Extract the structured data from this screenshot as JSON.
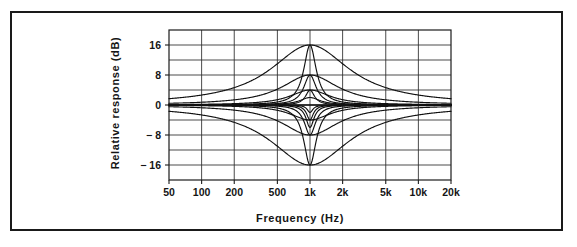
{
  "figure": {
    "border_color": "#1a1a1a",
    "background": "#ffffff",
    "curve_color": "#111111"
  },
  "axis_titles": {
    "x": "Frequency  (Hz)",
    "y": "Relative  response  (dB)"
  },
  "x_ticks": [
    {
      "label": "50",
      "value": 50
    },
    {
      "label": "100",
      "value": 100
    },
    {
      "label": "200",
      "value": 200
    },
    {
      "label": "500",
      "value": 500
    },
    {
      "label": "1k",
      "value": 1000
    },
    {
      "label": "2k",
      "value": 2000
    },
    {
      "label": "5k",
      "value": 5000
    },
    {
      "label": "10k",
      "value": 10000
    },
    {
      "label": "20k",
      "value": 20000
    }
  ],
  "y_ticks": [
    {
      "label": "16",
      "value": 16
    },
    {
      "label": "8",
      "value": 8
    },
    {
      "label": "0",
      "value": 0
    },
    {
      "label": "− 8",
      "value": -8
    },
    {
      "label": "− 16",
      "value": -16
    }
  ],
  "y_gridlines": [
    16,
    12,
    8,
    4,
    0,
    -4,
    -8,
    -12,
    -16
  ],
  "x_gridlines": [
    100,
    200,
    500,
    1000,
    2000,
    5000,
    10000
  ],
  "chart_data": {
    "type": "line",
    "title": "",
    "xlabel": "Frequency  (Hz)",
    "ylabel": "Relative  response  (dB)",
    "xscale": "log",
    "xlim": [
      50,
      20000
    ],
    "ylim": [
      -20,
      20
    ],
    "grid": true,
    "legend": "none",
    "center_frequency_hz": 1000,
    "x": [
      50,
      70,
      100,
      140,
      200,
      300,
      500,
      700,
      1000,
      1400,
      2000,
      3000,
      5000,
      7000,
      10000,
      14000,
      20000
    ],
    "series": [
      {
        "name": "+16 dB wide Q",
        "gain_db": 16,
        "q": 0.5,
        "values": [
          3.9,
          5.8,
          7.8,
          9.7,
          11.6,
          13.4,
          15.2,
          15.8,
          16.0,
          15.8,
          15.2,
          14.0,
          11.6,
          9.7,
          7.8,
          5.8,
          3.9
        ]
      },
      {
        "name": "+8 dB wide Q",
        "gain_db": 8,
        "q": 0.7,
        "values": [
          1.1,
          1.9,
          2.9,
          4.0,
          5.2,
          6.4,
          7.5,
          7.9,
          8.0,
          7.9,
          7.5,
          6.6,
          5.2,
          4.0,
          2.9,
          1.9,
          1.1
        ]
      },
      {
        "name": "+4 dB medium Q",
        "gain_db": 4,
        "q": 1.0,
        "values": [
          0.3,
          0.5,
          0.8,
          1.3,
          1.9,
          2.7,
          3.6,
          3.9,
          4.0,
          3.9,
          3.6,
          2.9,
          1.9,
          1.3,
          0.8,
          0.5,
          0.3
        ]
      },
      {
        "name": "+2 dB narrow Q",
        "gain_db": 2,
        "q": 2.0,
        "values": [
          0.0,
          0.1,
          0.1,
          0.2,
          0.3,
          0.6,
          1.3,
          1.8,
          2.0,
          1.8,
          1.3,
          0.7,
          0.3,
          0.2,
          0.1,
          0.1,
          0.0
        ]
      },
      {
        "name": "+16 dB narrow Q",
        "gain_db": 16,
        "q": 3.2,
        "values": [
          0.1,
          0.2,
          0.4,
          0.8,
          1.5,
          3.1,
          7.2,
          11.4,
          16.0,
          11.4,
          7.2,
          3.6,
          1.5,
          0.8,
          0.4,
          0.2,
          0.1
        ]
      },
      {
        "name": "+8 dB narrow Q",
        "gain_db": 8,
        "q": 3.2,
        "values": [
          0.0,
          0.1,
          0.2,
          0.4,
          0.8,
          1.6,
          3.7,
          5.8,
          8.0,
          5.8,
          3.7,
          1.9,
          0.8,
          0.4,
          0.2,
          0.1,
          0.0
        ]
      },
      {
        "name": "+4 dB very narrow Q",
        "gain_db": 4,
        "q": 4.5,
        "values": [
          0.0,
          0.0,
          0.1,
          0.1,
          0.3,
          0.6,
          1.6,
          2.7,
          4.0,
          2.7,
          1.6,
          0.7,
          0.3,
          0.1,
          0.1,
          0.0,
          0.0
        ]
      },
      {
        "name": "0 dB flat",
        "gain_db": 0,
        "q": 1.0,
        "values": [
          0,
          0,
          0,
          0,
          0,
          0,
          0,
          0,
          0,
          0,
          0,
          0,
          0,
          0,
          0,
          0,
          0
        ]
      },
      {
        "name": "−16 dB wide Q",
        "gain_db": -16,
        "q": 0.5,
        "values": [
          -3.9,
          -5.8,
          -7.8,
          -9.7,
          -11.6,
          -13.4,
          -15.2,
          -15.8,
          -16.0,
          -15.8,
          -15.2,
          -14.0,
          -11.6,
          -9.7,
          -7.8,
          -5.8,
          -3.9
        ]
      },
      {
        "name": "−8 dB wide Q",
        "gain_db": -8,
        "q": 0.7,
        "values": [
          -1.1,
          -1.9,
          -2.9,
          -4.0,
          -5.2,
          -6.4,
          -7.5,
          -7.9,
          -8.0,
          -7.9,
          -7.5,
          -6.6,
          -5.2,
          -4.0,
          -2.9,
          -1.9,
          -1.1
        ]
      },
      {
        "name": "−4 dB medium Q",
        "gain_db": -4,
        "q": 1.0,
        "values": [
          -0.3,
          -0.5,
          -0.8,
          -1.3,
          -1.9,
          -2.7,
          -3.6,
          -3.9,
          -4.0,
          -3.9,
          -3.6,
          -2.9,
          -1.9,
          -1.3,
          -0.8,
          -0.5,
          -0.3
        ]
      },
      {
        "name": "−16 dB narrow Q",
        "gain_db": -16,
        "q": 3.2,
        "values": [
          -0.1,
          -0.2,
          -0.4,
          -0.8,
          -1.5,
          -3.1,
          -7.2,
          -11.4,
          -16.0,
          -11.4,
          -7.2,
          -3.6,
          -1.5,
          -0.8,
          -0.4,
          -0.2,
          -0.1
        ]
      },
      {
        "name": "−8 dB narrow Q",
        "gain_db": -8,
        "q": 3.6,
        "values": [
          0.0,
          -0.1,
          -0.2,
          -0.3,
          -0.6,
          -1.3,
          -3.3,
          -5.5,
          -8.0,
          -5.5,
          -3.3,
          -1.6,
          -0.6,
          -0.3,
          -0.2,
          -0.1,
          0.0
        ]
      },
      {
        "name": "−6 dB very narrow Q",
        "gain_db": -6,
        "q": 5.0,
        "values": [
          0.0,
          0.0,
          0.0,
          -0.1,
          -0.2,
          -0.5,
          -1.7,
          -3.4,
          -6.0,
          -3.4,
          -1.7,
          -0.6,
          -0.2,
          -0.1,
          0.0,
          0.0,
          0.0
        ]
      },
      {
        "name": "−4 dB very narrow Q",
        "gain_db": -4,
        "q": 6.0,
        "values": [
          0.0,
          0.0,
          0.0,
          0.0,
          -0.1,
          -0.3,
          -1.0,
          -2.1,
          -4.0,
          -2.1,
          -1.0,
          -0.3,
          -0.1,
          0.0,
          0.0,
          0.0,
          0.0
        ]
      },
      {
        "name": "−2 dB very narrow Q",
        "gain_db": -2,
        "q": 7.0,
        "values": [
          0.0,
          0.0,
          0.0,
          0.0,
          0.0,
          -0.1,
          -0.4,
          -1.0,
          -2.0,
          -1.0,
          -0.4,
          -0.1,
          0.0,
          0.0,
          0.0,
          0.0,
          0.0
        ]
      }
    ]
  }
}
